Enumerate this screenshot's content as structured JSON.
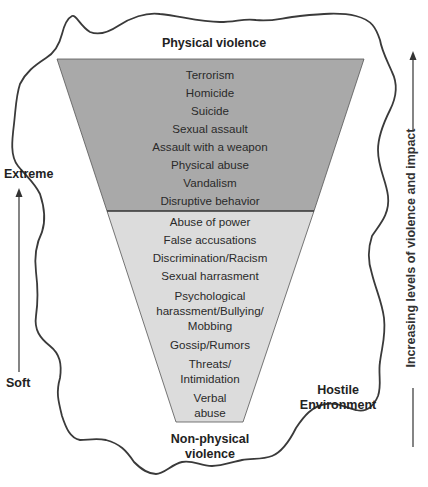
{
  "diagram": {
    "title_top": "Physical violence",
    "title_bottom_line1": "Non-physical",
    "title_bottom_line2": "violence",
    "left_axis": {
      "top_label": "Extreme",
      "bottom_label": "Soft"
    },
    "right_axis": {
      "label": "Increasing levels of violence and impact"
    },
    "hostile_label_line1": "Hostile",
    "hostile_label_line2": "Environment",
    "colors": {
      "physical_fill": "#a9a9a9",
      "nonphysical_fill": "#dcdcdc",
      "outline": "#3a3a3a"
    },
    "physical_items": [
      "Terrorism",
      "Homicide",
      "Suicide",
      "Sexual assault",
      "Assault with a weapon",
      "Physical abuse",
      "Vandalism",
      "Disruptive behavior"
    ],
    "nonphysical_items": [
      "Abuse of power",
      "False accusations",
      "Discrimination/Racism",
      "Sexual harrasment",
      "Psychological",
      "harassment/Bullying/",
      "Mobbing",
      "Gossip/Rumors",
      "Threats/",
      "Intimidation",
      "Verbal",
      "abuse"
    ]
  }
}
